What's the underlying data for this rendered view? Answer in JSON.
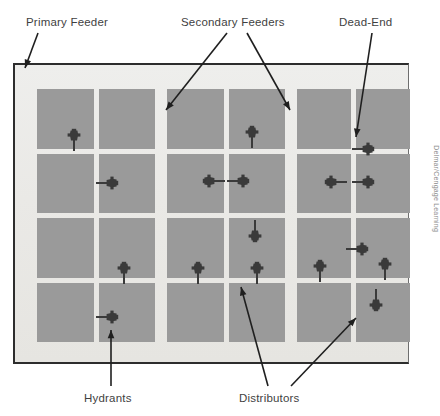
{
  "figure": {
    "credit": "Delmar/Cengage Learning"
  },
  "labels": {
    "primary_feeder": "Primary Feeder",
    "secondary_feeders": "Secondary Feeders",
    "dead_end": "Dead-End",
    "hydrants": "Hydrants",
    "distributors": "Distributors"
  },
  "colors": {
    "block_fill": "#9a9a9a",
    "plate_fill": "#eae9e6",
    "street_fill": "#ffffff",
    "frame_stroke": "#2d2d2d",
    "symbol_fill": "#3a3a3a",
    "label_text": "#3f3f3f",
    "credit_text": "#8c8c8c"
  },
  "plate": {
    "x": 13,
    "y": 63,
    "width": 396,
    "height": 301
  },
  "superblocks": [
    {
      "name": "west-superblock",
      "x": 35,
      "y": 87,
      "width": 118,
      "height": 253,
      "cols": 2,
      "rows": 4
    },
    {
      "name": "center-superblock",
      "x": 165,
      "y": 87,
      "width": 118,
      "height": 253,
      "cols": 2,
      "rows": 4
    },
    {
      "name": "east-superblock",
      "x": 295,
      "y": 87,
      "width": 113,
      "height": 253,
      "cols": 2,
      "rows": 4
    }
  ],
  "hydrants": [
    {
      "id": "h1",
      "x": 74,
      "y": 137,
      "orientation": "down"
    },
    {
      "id": "h2",
      "x": 252,
      "y": 134,
      "orientation": "down"
    },
    {
      "id": "h3",
      "x": 366,
      "y": 149,
      "orientation": "left"
    },
    {
      "id": "h4",
      "x": 110,
      "y": 183,
      "orientation": "left"
    },
    {
      "id": "h5",
      "x": 211,
      "y": 181,
      "orientation": "right"
    },
    {
      "id": "h6",
      "x": 241,
      "y": 181,
      "orientation": "left"
    },
    {
      "id": "h7",
      "x": 333,
      "y": 182,
      "orientation": "right"
    },
    {
      "id": "h8",
      "x": 366,
      "y": 182,
      "orientation": "left"
    },
    {
      "id": "h9",
      "x": 255,
      "y": 234,
      "orientation": "up"
    },
    {
      "id": "h10",
      "x": 360,
      "y": 249,
      "orientation": "left"
    },
    {
      "id": "h11",
      "x": 124,
      "y": 270,
      "orientation": "down"
    },
    {
      "id": "h12",
      "x": 198,
      "y": 270,
      "orientation": "down"
    },
    {
      "id": "h13",
      "x": 257,
      "y": 270,
      "orientation": "down"
    },
    {
      "id": "h14",
      "x": 320,
      "y": 268,
      "orientation": "down"
    },
    {
      "id": "h15",
      "x": 385,
      "y": 266,
      "orientation": "down"
    },
    {
      "id": "h16",
      "x": 376,
      "y": 303,
      "orientation": "up"
    },
    {
      "id": "h17",
      "x": 110,
      "y": 317,
      "orientation": "left"
    }
  ],
  "leader_lines": [
    {
      "name": "primary-feeder-leader",
      "x1": 38,
      "y1": 33,
      "x2": 25,
      "y2": 68
    },
    {
      "name": "secondary-feeder-leader-l",
      "x1": 227,
      "y1": 33,
      "x2": 166,
      "y2": 110
    },
    {
      "name": "secondary-feeder-leader-r",
      "x1": 247,
      "y1": 33,
      "x2": 290,
      "y2": 110
    },
    {
      "name": "dead-end-leader",
      "x1": 372,
      "y1": 33,
      "x2": 356,
      "y2": 137
    },
    {
      "name": "hydrants-leader",
      "x1": 111,
      "y1": 386,
      "x2": 111,
      "y2": 330
    },
    {
      "name": "distributors-leader-l",
      "x1": 268,
      "y1": 386,
      "x2": 241,
      "y2": 287
    },
    {
      "name": "distributors-leader-r",
      "x1": 291,
      "y1": 386,
      "x2": 356,
      "y2": 318
    }
  ]
}
